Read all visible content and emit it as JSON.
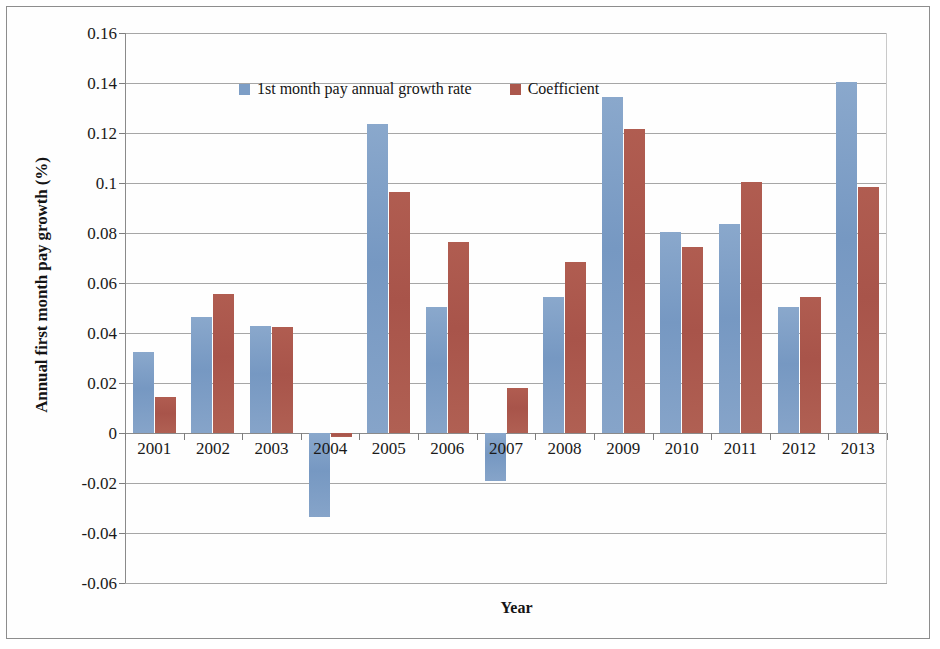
{
  "chart_data": {
    "type": "bar",
    "title": "",
    "xlabel": "Year",
    "ylabel": "Annual first month pay growth (%)",
    "categories": [
      "2001",
      "2002",
      "2003",
      "2004",
      "2005",
      "2006",
      "2007",
      "2008",
      "2009",
      "2010",
      "2011",
      "2012",
      "2013"
    ],
    "series": [
      {
        "name": "1st month pay annual growth rate",
        "color": "#7d9ec6",
        "values": [
          0.0325,
          0.0465,
          0.043,
          -0.0335,
          0.1235,
          0.0505,
          -0.019,
          0.0545,
          0.1345,
          0.0805,
          0.0835,
          0.0505,
          0.1405
        ]
      },
      {
        "name": "Coefficient",
        "color": "#ab574c",
        "values": [
          0.0145,
          0.0555,
          0.0425,
          -0.0015,
          0.0965,
          0.0765,
          0.018,
          0.0685,
          0.1215,
          0.0745,
          0.1005,
          0.0545,
          0.0985
        ]
      }
    ],
    "ylim": [
      -0.06,
      0.16
    ],
    "ytick_step": 0.02,
    "ytick_labels": [
      "0.16",
      "0.14",
      "0.12",
      "0.1",
      "0.08",
      "0.06",
      "0.04",
      "0.02",
      "0",
      "-0.02",
      "-0.04",
      "-0.06"
    ],
    "ytick_values": [
      0.16,
      0.14,
      0.12,
      0.1,
      0.08,
      0.06,
      0.04,
      0.02,
      0,
      -0.02,
      -0.04,
      -0.06
    ],
    "grid": true,
    "grid_axis": "y",
    "legend_position": "top-inside"
  },
  "legend": {
    "entries": [
      {
        "label": "1st month pay annual growth rate"
      },
      {
        "label": "Coefficient"
      }
    ]
  },
  "axes": {
    "y_title": "Annual first month pay growth (%)",
    "x_title": "Year"
  }
}
